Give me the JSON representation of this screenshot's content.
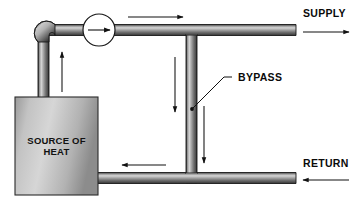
{
  "diagram": {
    "background_color": "#ffffff",
    "labels": {
      "supply": "SUPPLY",
      "return": "RETURN",
      "bypass": "BYPASS",
      "source_line1": "SOURCE OF",
      "source_line2": "HEAT"
    },
    "components": {
      "heat_source": {
        "name": "SOURCE OF HEAT",
        "fill_light": "#d2d2d2",
        "fill_dark": "#8d8d8d",
        "stroke": "#2b2b2b"
      },
      "pump": {
        "name": "pump",
        "fill": "#ffffff",
        "stroke": "#1a1a1a",
        "flow_direction": "right"
      },
      "pipe": {
        "highlight": "#cfcfcf",
        "mid": "#9a9a9a",
        "shadow": "#4a4a4a",
        "edge": "#222222"
      }
    },
    "flow_arrows": [
      {
        "name": "riser-up-arrow",
        "direction": "up"
      },
      {
        "name": "supply-top-arrow",
        "direction": "right"
      },
      {
        "name": "supply-out-arrow",
        "direction": "right"
      },
      {
        "name": "bypass-left-down-arrow",
        "direction": "down"
      },
      {
        "name": "bypass-right-down-arrow",
        "direction": "down"
      },
      {
        "name": "return-in-arrow",
        "direction": "left"
      },
      {
        "name": "return-left-arrow",
        "direction": "left"
      }
    ]
  }
}
